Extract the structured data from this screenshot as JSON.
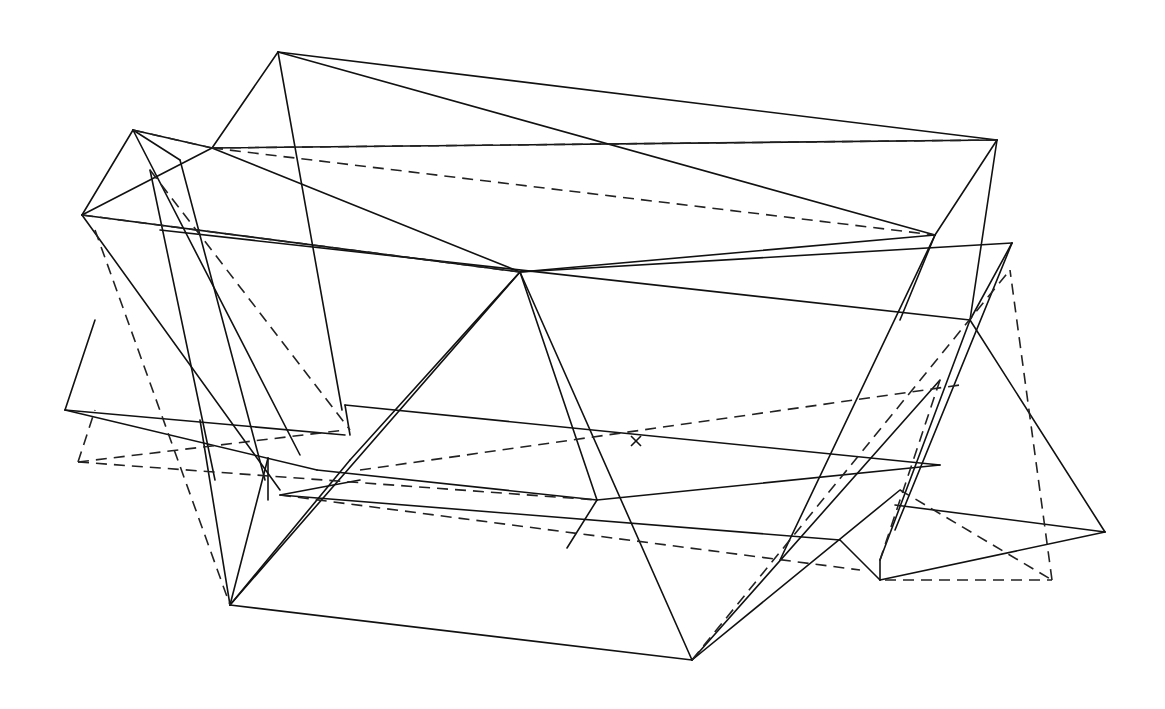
{
  "figure": {
    "type": "wireframe-polyhedron-overlay",
    "stroke_color": "#111111",
    "background": "#ffffff",
    "marker": {
      "label": "x",
      "x": 636,
      "y": 441
    },
    "solid_edges": [
      [
        278,
        52,
        997,
        140
      ],
      [
        278,
        52,
        212,
        148
      ],
      [
        278,
        52,
        342,
        410
      ],
      [
        278,
        52,
        935,
        235
      ],
      [
        997,
        140,
        935,
        235
      ],
      [
        997,
        140,
        970,
        320
      ],
      [
        212,
        148,
        997,
        140
      ],
      [
        212,
        148,
        520,
        272
      ],
      [
        212,
        148,
        82,
        215
      ],
      [
        212,
        148,
        133,
        130
      ],
      [
        133,
        130,
        82,
        215
      ],
      [
        133,
        130,
        300,
        455
      ],
      [
        133,
        130,
        180,
        160
      ],
      [
        82,
        215,
        520,
        272
      ],
      [
        82,
        215,
        280,
        490
      ],
      [
        520,
        272,
        935,
        235
      ],
      [
        520,
        272,
        1012,
        243
      ],
      [
        520,
        272,
        350,
        460
      ],
      [
        520,
        272,
        230,
        605
      ],
      [
        520,
        272,
        692,
        660
      ],
      [
        520,
        272,
        597,
        500
      ],
      [
        935,
        235,
        900,
        320
      ],
      [
        935,
        235,
        780,
        560
      ],
      [
        1012,
        243,
        970,
        320
      ],
      [
        1012,
        243,
        895,
        530
      ],
      [
        160,
        230,
        970,
        320
      ],
      [
        970,
        320,
        1105,
        532
      ],
      [
        970,
        320,
        880,
        560
      ],
      [
        65,
        410,
        95,
        320
      ],
      [
        65,
        410,
        345,
        435
      ],
      [
        65,
        410,
        317,
        470
      ],
      [
        345,
        405,
        940,
        465
      ],
      [
        345,
        405,
        350,
        435
      ],
      [
        317,
        470,
        597,
        500
      ],
      [
        597,
        500,
        940,
        465
      ],
      [
        230,
        605,
        692,
        660
      ],
      [
        230,
        605,
        268,
        458
      ],
      [
        230,
        605,
        200,
        420
      ],
      [
        230,
        605,
        350,
        460
      ],
      [
        268,
        458,
        268,
        500
      ],
      [
        280,
        495,
        840,
        540
      ],
      [
        280,
        495,
        360,
        480
      ],
      [
        692,
        660,
        900,
        490
      ],
      [
        692,
        660,
        940,
        380
      ],
      [
        840,
        540,
        880,
        580
      ],
      [
        880,
        580,
        1105,
        532
      ],
      [
        880,
        580,
        880,
        560
      ],
      [
        895,
        505,
        1105,
        532
      ],
      [
        597,
        500,
        567,
        548
      ],
      [
        180,
        160,
        265,
        480
      ],
      [
        150,
        170,
        215,
        480
      ]
    ],
    "dashed_edges": [
      [
        212,
        148,
        997,
        140
      ],
      [
        212,
        148,
        935,
        235
      ],
      [
        133,
        130,
        212,
        148
      ],
      [
        82,
        215,
        520,
        272
      ],
      [
        95,
        230,
        230,
        605
      ],
      [
        150,
        170,
        350,
        430
      ],
      [
        78,
        462,
        345,
        430
      ],
      [
        78,
        462,
        597,
        500
      ],
      [
        78,
        462,
        95,
        410
      ],
      [
        280,
        495,
        860,
        570
      ],
      [
        360,
        470,
        960,
        385
      ],
      [
        885,
        580,
        1052,
        580
      ],
      [
        1052,
        580,
        1010,
        270
      ],
      [
        900,
        490,
        1052,
        580
      ],
      [
        692,
        660,
        1010,
        270
      ],
      [
        940,
        380,
        880,
        560
      ]
    ]
  }
}
